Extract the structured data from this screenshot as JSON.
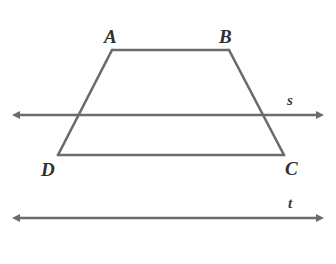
{
  "figure": {
    "background_color": "#ffffff",
    "stroke_color": "#6b6b6b",
    "label_color": "#2f2f2f",
    "width": 336,
    "height": 264
  },
  "chart_data": {
    "type": "diagram",
    "subtype": "plane-geometry",
    "shapes": [
      {
        "name": "trapezoid-ABCD",
        "kind": "polygon",
        "closed": true,
        "vertices": [
          {
            "label": "A",
            "x": 112,
            "y": 50
          },
          {
            "label": "B",
            "x": 229,
            "y": 50
          },
          {
            "label": "C",
            "x": 284,
            "y": 155
          },
          {
            "label": "D",
            "x": 58,
            "y": 155
          }
        ],
        "edges": [
          "AB",
          "BC",
          "CD",
          "DA"
        ]
      },
      {
        "name": "line-s",
        "kind": "line",
        "label": "s",
        "double_arrow": true,
        "x1": 20,
        "y1": 115,
        "x2": 316,
        "y2": 115
      },
      {
        "name": "line-t",
        "kind": "line",
        "label": "t",
        "double_arrow": true,
        "x1": 20,
        "y1": 218,
        "x2": 316,
        "y2": 218
      }
    ],
    "intersections": [
      {
        "of": [
          "line-s",
          "DA"
        ],
        "x": 78,
        "y": 115
      },
      {
        "of": [
          "line-s",
          "BC"
        ],
        "x": 265,
        "y": 115
      }
    ]
  },
  "labels": {
    "vertex_a": "A",
    "vertex_b": "B",
    "vertex_c": "C",
    "vertex_d": "D",
    "line_s": "s",
    "line_t": "t"
  }
}
